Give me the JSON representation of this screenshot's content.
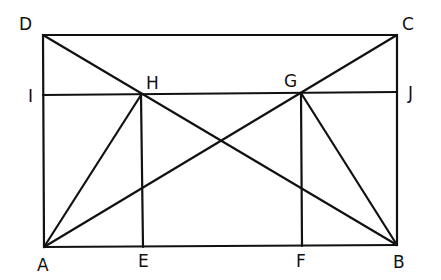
{
  "diagram": {
    "type": "geometric-construction",
    "stroke_color": "#111111",
    "background": "#ffffff",
    "points": {
      "A": {
        "x": 44,
        "y": 247
      },
      "B": {
        "x": 397,
        "y": 245
      },
      "C": {
        "x": 397,
        "y": 35
      },
      "D": {
        "x": 43,
        "y": 35
      },
      "E": {
        "x": 143,
        "y": 247
      },
      "F": {
        "x": 302,
        "y": 246
      },
      "G": {
        "x": 301,
        "y": 93
      },
      "H": {
        "x": 141,
        "y": 95
      },
      "I": {
        "x": 43,
        "y": 95
      },
      "J": {
        "x": 397,
        "y": 92
      }
    },
    "segments": [
      [
        "D",
        "C"
      ],
      [
        "C",
        "B"
      ],
      [
        "B",
        "A"
      ],
      [
        "A",
        "D"
      ],
      [
        "D",
        "B"
      ],
      [
        "A",
        "C"
      ],
      [
        "I",
        "J"
      ],
      [
        "H",
        "E"
      ],
      [
        "G",
        "F"
      ],
      [
        "A",
        "H"
      ],
      [
        "B",
        "G"
      ]
    ],
    "labels": {
      "A": "A",
      "B": "B",
      "C": "C",
      "D": "D",
      "E": "E",
      "F": "F",
      "G": "G",
      "H": "H",
      "I": "I",
      "J": "J"
    }
  }
}
